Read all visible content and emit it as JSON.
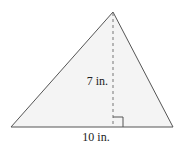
{
  "figure": {
    "shape": "triangle",
    "fill_color": "#f4f4f4",
    "stroke_color": "#555555",
    "height_label": "7 in.",
    "base_label": "10 in.",
    "height_value": 7,
    "base_value": 10,
    "unit": "in.",
    "right_angle_marker": true
  }
}
